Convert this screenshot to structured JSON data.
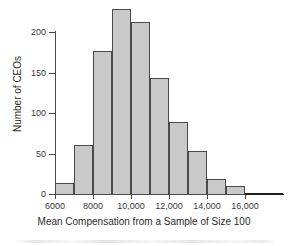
{
  "figure": {
    "background_color": "#ffffff",
    "bar_fill_color": "#c9c9c9",
    "bar_edge_color": "#4a4a4a",
    "axis_color": "#4a4a4a"
  },
  "chart_data": {
    "type": "bar",
    "title": "",
    "subtitle": "",
    "xlabel": "Mean Compensation from a Sample of Size 100",
    "ylabel": "Number of CEOs",
    "grid": false,
    "legend": null,
    "legend_position": "none",
    "xlim": [
      6000,
      18000
    ],
    "ylim": [
      0,
      230
    ],
    "xticks": [
      6000,
      8000,
      10000,
      12000,
      14000,
      16000
    ],
    "xtick_labels": [
      "6000",
      "8000",
      "10,000",
      "12,000",
      "14,000",
      "16,000"
    ],
    "yticks": [
      0,
      50,
      100,
      150,
      200
    ],
    "ytick_labels": [
      "0",
      "50",
      "100",
      "150",
      "200"
    ],
    "bin_width": 1000,
    "bin_edges": [
      6000,
      7000,
      8000,
      9000,
      10000,
      11000,
      12000,
      13000,
      14000,
      15000,
      16000,
      18000
    ],
    "categories": [
      "6000-7000",
      "7000-8000",
      "8000-9000",
      "9000-10,000",
      "10,000-11,000",
      "11,000-12,000",
      "12,000-13,000",
      "13,000-14,000",
      "14,000-15,000",
      "15,000-16,000",
      "16,000-18,000"
    ],
    "values": [
      13,
      61,
      177,
      229,
      212,
      143,
      89,
      53,
      18,
      10,
      1
    ],
    "annotations": []
  }
}
